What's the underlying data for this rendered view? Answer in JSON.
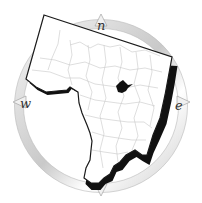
{
  "map": {
    "type": "county outline map with compass rose",
    "compass": {
      "north": "n",
      "east": "e",
      "west": "w"
    },
    "colors": {
      "background": "#ffffff",
      "land": "#ffffff",
      "outline": "#1a1a1a",
      "shadow": "#111111",
      "subdivision_lines": "#c8c8c8",
      "compass_ring": "#d8d8d8",
      "highlight_city": "#111111"
    }
  }
}
